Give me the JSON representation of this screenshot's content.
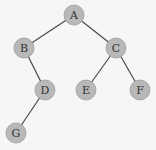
{
  "diagram": {
    "type": "binary-tree",
    "nodes": [
      {
        "id": "A",
        "label": "A",
        "x": 74,
        "y": 15
      },
      {
        "id": "B",
        "label": "B",
        "x": 24,
        "y": 48
      },
      {
        "id": "C",
        "label": "C",
        "x": 116,
        "y": 48
      },
      {
        "id": "D",
        "label": "D",
        "x": 45,
        "y": 90
      },
      {
        "id": "E",
        "label": "E",
        "x": 86,
        "y": 90
      },
      {
        "id": "F",
        "label": "F",
        "x": 140,
        "y": 90
      },
      {
        "id": "G",
        "label": "G",
        "x": 16,
        "y": 133
      }
    ],
    "edges": [
      {
        "from": "A",
        "to": "B"
      },
      {
        "from": "A",
        "to": "C"
      },
      {
        "from": "B",
        "to": "D"
      },
      {
        "from": "C",
        "to": "E"
      },
      {
        "from": "C",
        "to": "F"
      },
      {
        "from": "D",
        "to": "G"
      }
    ],
    "colors": {
      "node_fill": "#b8b8b8",
      "edge": "#4a4a4a",
      "background": "#f6f6f6"
    }
  }
}
